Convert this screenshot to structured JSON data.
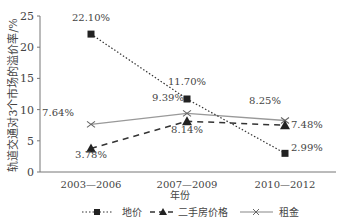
{
  "chart_data": {
    "type": "line",
    "title": "",
    "xlabel": "年份",
    "ylabel": "轨道交通对3个市场的溢价率/%",
    "categories": [
      "2003—2006",
      "2007—2009",
      "2010—2012"
    ],
    "ylim": [
      0,
      25
    ],
    "yticks": [
      0,
      5,
      10,
      15,
      20,
      25
    ],
    "grid": false,
    "legend_position": "bottom",
    "series": [
      {
        "name": "地价",
        "values": [
          22.1,
          11.7,
          2.99
        ],
        "labels": [
          "22.10%",
          "11.70%",
          "2.99%"
        ],
        "style": "dotted",
        "marker": "square"
      },
      {
        "name": "二手房价格",
        "values": [
          3.78,
          8.14,
          7.48
        ],
        "labels": [
          "3.78%",
          "8.14%",
          "7.48%"
        ],
        "style": "dashed",
        "marker": "triangle"
      },
      {
        "name": "租金",
        "values": [
          7.64,
          9.39,
          8.25
        ],
        "labels": [
          "7.64%",
          "9.39%",
          "8.25%"
        ],
        "style": "solid",
        "marker": "x"
      }
    ]
  }
}
